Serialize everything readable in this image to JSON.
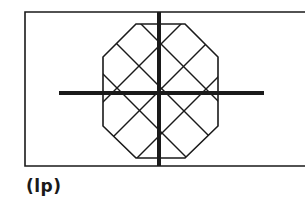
{
  "figure": {
    "caption": "(lp)",
    "stroke_color": "#1a1a1a",
    "background": "#ffffff",
    "frame": {
      "x": 25,
      "y": 12,
      "right": 305,
      "bottom": 166
    },
    "octagon": [
      [
        136,
        24
      ],
      [
        185,
        24
      ],
      [
        218,
        57
      ],
      [
        218,
        126
      ],
      [
        185,
        158
      ],
      [
        136,
        158
      ],
      [
        103,
        126
      ],
      [
        103,
        57
      ]
    ],
    "hatch": {
      "slash_sums": [
        205,
        250,
        295
      ],
      "backslash_diffs": [
        117,
        73,
        29
      ]
    },
    "crosshair": {
      "vertical": {
        "x": 159,
        "y1": 12,
        "y2": 166
      },
      "horizontal": {
        "y": 93,
        "x1": 59,
        "x2": 264
      }
    }
  }
}
